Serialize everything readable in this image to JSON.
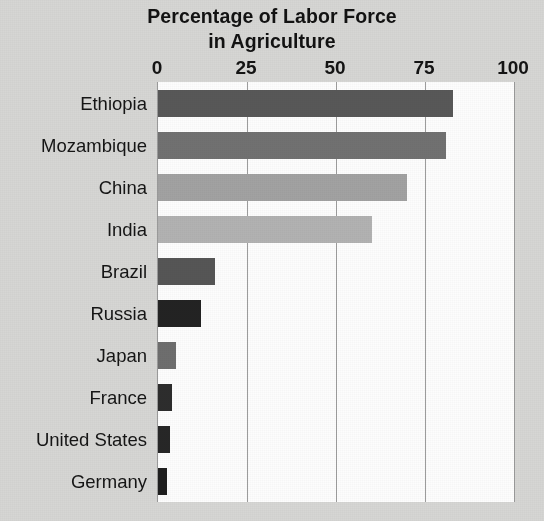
{
  "chart_data": {
    "type": "bar",
    "orientation": "horizontal",
    "title": "Percentage of Labor Force in Agriculture",
    "title_lines": [
      "Percentage of Labor Force",
      "in Agriculture"
    ],
    "xlabel": "",
    "ylabel": "",
    "xlim": [
      0,
      100
    ],
    "xticks": [
      0,
      25,
      50,
      75,
      100
    ],
    "xtick_labels": [
      "0",
      "25",
      "50",
      "75",
      "100"
    ],
    "grid": "vertical gridlines at 25, 50, 75",
    "legend": "none",
    "categories": [
      "Ethiopia",
      "Mozambique",
      "China",
      "India",
      "Brazil",
      "Russia",
      "Japan",
      "France",
      "United States",
      "Germany"
    ],
    "values": [
      83,
      81,
      70,
      60,
      16,
      12,
      5,
      4,
      3.5,
      2.5
    ],
    "bars": [
      {
        "category": "Ethiopia",
        "value": 83,
        "color": "#585858"
      },
      {
        "category": "Mozambique",
        "value": 81,
        "color": "#717171"
      },
      {
        "category": "China",
        "value": 70,
        "color": "#a2a2a2"
      },
      {
        "category": "India",
        "value": 60,
        "color": "#b2b2b2"
      },
      {
        "category": "Brazil",
        "value": 16,
        "color": "#565656"
      },
      {
        "category": "Russia",
        "value": 12,
        "color": "#232323"
      },
      {
        "category": "Japan",
        "value": 5,
        "color": "#6e6e6e"
      },
      {
        "category": "France",
        "value": 4,
        "color": "#2d2d2d"
      },
      {
        "category": "United States",
        "value": 3.5,
        "color": "#272727"
      },
      {
        "category": "Germany",
        "value": 2.5,
        "color": "#1f1f1f"
      }
    ]
  },
  "figure": {
    "background_color": "#d6d6d4",
    "plot_background_color": "#fdfdfd",
    "axis_color": "#9a9a9a",
    "text_color": "#141414"
  },
  "caption": {
    "partial_text": ""
  }
}
